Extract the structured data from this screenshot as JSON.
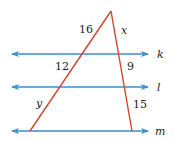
{
  "diagram": {
    "type": "triangle with parallel transversals",
    "colors": {
      "parallel_lines": "#3a8fd0",
      "triangle": "#d9432e",
      "text": "#231f20"
    },
    "lines": [
      {
        "name": "k",
        "label": "k"
      },
      {
        "name": "l",
        "label": "l"
      },
      {
        "name": "m",
        "label": "m"
      }
    ],
    "segments": {
      "left_top": "16",
      "left_mid": "12",
      "left_bottom": "y",
      "right_top": "x",
      "right_mid": "9",
      "right_bottom": "15"
    }
  }
}
